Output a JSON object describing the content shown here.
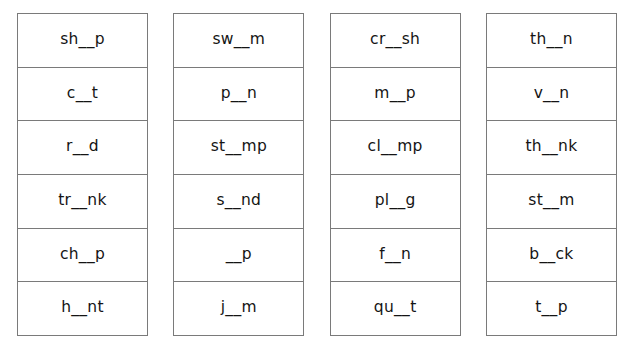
{
  "worksheet": {
    "title": "Word Blanks Worksheet",
    "colors": {
      "background": "#ffffff",
      "border": "#7a7a7a",
      "text": "#141414"
    },
    "blank_marker": "__",
    "columns": [
      {
        "index": 1,
        "cells": [
          {
            "word": "sh__p"
          },
          {
            "word": "c__t"
          },
          {
            "word": "r__d"
          },
          {
            "word": "tr__nk"
          },
          {
            "word": "ch__p"
          },
          {
            "word": "h__nt"
          }
        ]
      },
      {
        "index": 2,
        "cells": [
          {
            "word": "sw__m"
          },
          {
            "word": "p__n"
          },
          {
            "word": "st__mp"
          },
          {
            "word": "s__nd"
          },
          {
            "word": "__p"
          },
          {
            "word": "j__m"
          }
        ]
      },
      {
        "index": 3,
        "cells": [
          {
            "word": "cr__sh"
          },
          {
            "word": "m__p"
          },
          {
            "word": "cl__mp"
          },
          {
            "word": "pl__g"
          },
          {
            "word": "f__n"
          },
          {
            "word": "qu__t"
          }
        ]
      },
      {
        "index": 4,
        "cells": [
          {
            "word": "th__n"
          },
          {
            "word": "v__n"
          },
          {
            "word": "th__nk"
          },
          {
            "word": "st__m"
          },
          {
            "word": "b__ck"
          },
          {
            "word": "t__p"
          }
        ]
      }
    ]
  }
}
